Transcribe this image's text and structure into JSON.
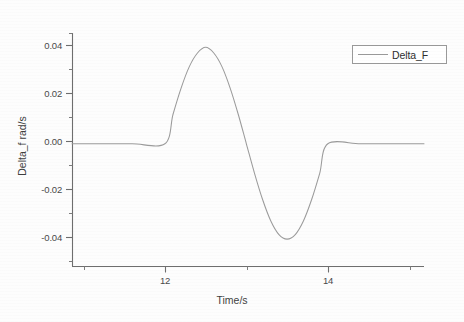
{
  "chart_data": {
    "type": "line",
    "title": "",
    "xlabel": "Time/s",
    "ylabel": "Delta_f rad/s",
    "xlim": [
      10.86,
      15.18
    ],
    "ylim": [
      -0.0515,
      0.0465
    ],
    "grid": false,
    "legend_position": "top-right",
    "x_ticks": [
      12,
      14
    ],
    "x_tick_labels": [
      "12",
      "14"
    ],
    "x_minor_ticks": [
      11,
      13,
      15
    ],
    "y_ticks": [
      0.04,
      0.02,
      0.0,
      -0.02,
      -0.04
    ],
    "y_tick_labels": [
      "0.04",
      "0.02",
      "0.00",
      "-0.02",
      "-0.04"
    ],
    "y_minor_ticks": [
      0.03,
      0.01,
      -0.01,
      -0.03
    ],
    "series": [
      {
        "name": "Delta_F",
        "color": "#9b9b9b",
        "description": "Zero before t=12 s, one full sine cycle of amplitude 0.04 rad/s between t=12 s and t=14 s (positive half first, peak 0.0405 at t=12.5 s, trough -0.0400 at t=13.5 s), zero after t=14 s.",
        "x": [
          10.86,
          11.2,
          11.6,
          12.0,
          12.1,
          12.2,
          12.3,
          12.4,
          12.5,
          12.6,
          12.7,
          12.8,
          12.9,
          13.0,
          13.1,
          13.2,
          13.3,
          13.4,
          13.5,
          13.6,
          13.7,
          13.8,
          13.9,
          14.0,
          14.4,
          14.8,
          15.18
        ],
        "y": [
          0.0,
          0.0,
          0.0,
          0.0,
          0.0124,
          0.0235,
          0.0324,
          0.0381,
          0.0405,
          0.0381,
          0.0324,
          0.0235,
          0.0124,
          0.0,
          -0.0124,
          -0.0235,
          -0.0324,
          -0.0381,
          -0.04,
          -0.0381,
          -0.0324,
          -0.0235,
          -0.0124,
          0.0,
          0.0,
          0.0,
          0.0
        ]
      }
    ],
    "annotations": []
  },
  "legend": {
    "entries": [
      {
        "label": "Delta_F"
      }
    ]
  },
  "axes": {
    "x_title": "Time/s",
    "y_title": "Delta_f rad/s",
    "x_tick_labels": [
      "12",
      "14"
    ],
    "y_tick_labels": [
      "0.04",
      "0.02",
      "0.00",
      "-0.02",
      "-0.04"
    ]
  }
}
